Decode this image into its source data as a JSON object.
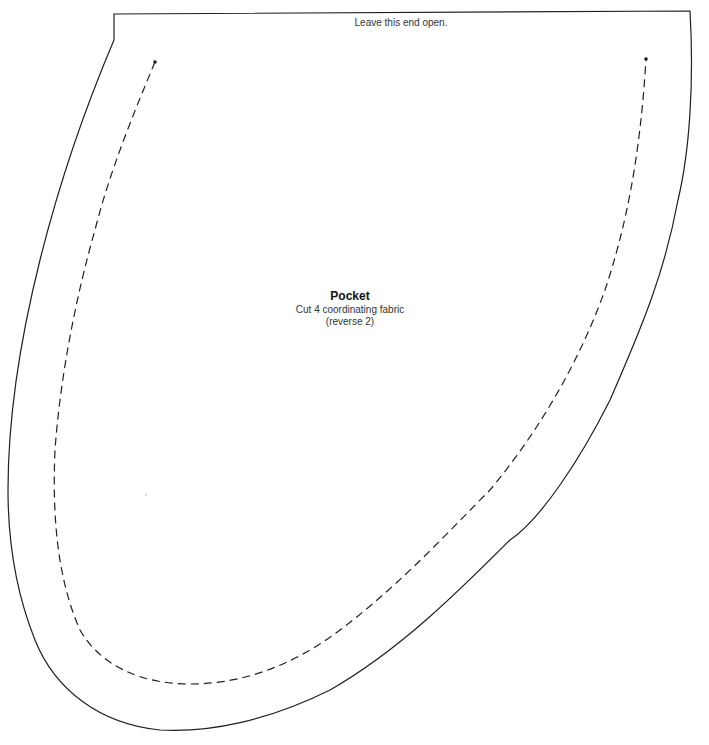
{
  "pattern": {
    "top_note": "Leave this end open.",
    "piece": {
      "name": "Pocket",
      "instruction": "Cut 4 coordinating fabric",
      "note": "(reverse 2)"
    },
    "colors": {
      "outline": "#231f20",
      "stitch_line": "#231f20",
      "background": "#ffffff"
    },
    "lines": {
      "cut_line": "solid",
      "stitch_line": "dashed"
    }
  }
}
